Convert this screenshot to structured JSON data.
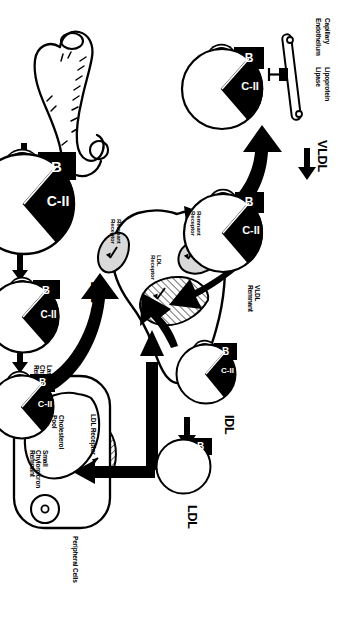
{
  "figure": {
    "kind": "lipoprotein-metabolism-diagram",
    "orientation": "rotated-90-clockwise",
    "ink": "#000000",
    "paper": "#ffffff"
  },
  "organs": {
    "intestine": "Intestine",
    "liver": "Liver",
    "peripheral_cells": "Peripheral Cells"
  },
  "particles": {
    "chylomicron": {
      "label": "Chylomicron",
      "apos": [
        "C-II",
        "B",
        "E"
      ]
    },
    "large_chylomicron_remnant": {
      "label": "Large\nChylomicron\nRemnant",
      "apos": [
        "C-II",
        "B",
        "E"
      ]
    },
    "small_chylomicron_remnant": {
      "label": "Small\nChylomicron\nRemnant",
      "apos": [
        "C-II",
        "B",
        "E"
      ]
    },
    "vldl": {
      "label": "VLDL",
      "apos": [
        "C-II",
        "B",
        "E"
      ]
    },
    "vldl_remnant": {
      "label": "VLDL\nRemnant",
      "apos": [
        "C-II",
        "B",
        "E"
      ]
    },
    "idl": {
      "label": "IDL",
      "apos": [
        "C-II",
        "B",
        "E"
      ]
    },
    "ldl": {
      "label": "LDL",
      "apos": [
        "B"
      ]
    }
  },
  "apoproteins": {
    "b": "B",
    "e": "E",
    "cii": "C-II"
  },
  "enzyme_callouts": [
    {
      "id": "lpl-intestine",
      "line1": "Capillary",
      "line2": "Endothelium",
      "line3": "Lipoprotein",
      "line4": "Lipase"
    },
    {
      "id": "lpl-liver",
      "line1": "Capillary",
      "line2": "Endothelium",
      "line3": "Lipoprotein",
      "line4": "Lipase"
    }
  ],
  "receptors": {
    "remnant_receptor_upper": "Remnant\nReceptor",
    "remnant_receptor_lower": "Remnant\nReceptor",
    "ldl_receptor_liver": "LDL\nReceptor",
    "ldl_receptor_cell": "LDL Receptor"
  },
  "cell_internals": {
    "cholesterol_pool": "Cholesterol\nPool"
  }
}
